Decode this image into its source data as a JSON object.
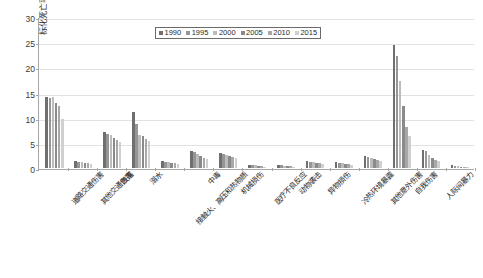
{
  "chart_data": {
    "type": "bar",
    "title": "",
    "subtitle": "",
    "xlabel": "",
    "ylabel": "标化死亡率（/10万）",
    "ylim": [
      0,
      30
    ],
    "yticks": [
      0,
      5,
      10,
      15,
      20,
      25,
      30
    ],
    "grid": true,
    "legend_position": "top-center",
    "categories": [
      "道路交通伤害",
      "其他交通伤害",
      "跌落",
      "溺水",
      "接触火、高压和热物质",
      "中毒",
      "机械损伤",
      "医疗不良反应",
      "动物袭击",
      "异物损伤",
      "冷热环境暴露",
      "其他意外伤害",
      "自我伤害",
      "人际间暴力",
      "自然灾害、战争和法律干预"
    ],
    "series": [
      {
        "name": "1990",
        "color": "#6f6f6f",
        "values": [
          14.2,
          1.3,
          7.2,
          11.1,
          1.3,
          3.4,
          2.9,
          0.5,
          0.5,
          1.3,
          1.1,
          2.3,
          24.5,
          3.6,
          0.5
        ]
      },
      {
        "name": "1995",
        "color": "#969696",
        "values": [
          14.0,
          1.2,
          6.8,
          8.7,
          1.2,
          3.1,
          2.7,
          0.5,
          0.5,
          1.2,
          1.0,
          2.1,
          22.3,
          3.3,
          0.4
        ]
      },
      {
        "name": "2000",
        "color": "#bcbcbc",
        "values": [
          14.2,
          1.1,
          6.5,
          6.6,
          1.1,
          2.7,
          2.5,
          0.5,
          0.4,
          1.1,
          0.9,
          1.9,
          17.3,
          2.6,
          0.4
        ]
      },
      {
        "name": "2005",
        "color": "#8a8a8a",
        "values": [
          13.0,
          1.0,
          6.0,
          6.4,
          1.0,
          2.3,
          2.3,
          0.4,
          0.4,
          1.0,
          0.8,
          1.7,
          12.3,
          2.0,
          0.3
        ]
      },
      {
        "name": "2010",
        "color": "#a8a8a8",
        "values": [
          12.3,
          0.9,
          5.6,
          5.8,
          0.9,
          2.0,
          2.1,
          0.4,
          0.4,
          0.9,
          0.7,
          1.5,
          8.1,
          1.6,
          0.3
        ]
      },
      {
        "name": "2015",
        "color": "#d0d0d0",
        "values": [
          9.8,
          0.8,
          5.2,
          5.4,
          0.8,
          1.7,
          1.9,
          0.3,
          0.3,
          0.8,
          0.6,
          1.3,
          6.4,
          1.3,
          0.2
        ]
      }
    ]
  }
}
